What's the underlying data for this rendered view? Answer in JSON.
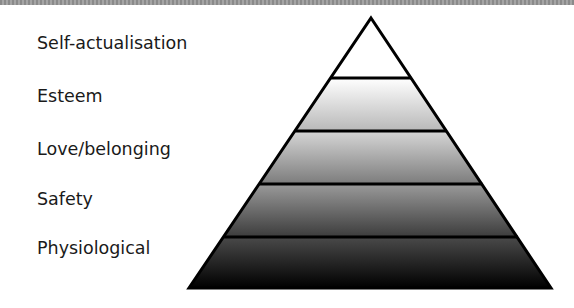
{
  "diagram": {
    "title": "",
    "type": "pyramid",
    "levels": [
      {
        "label": "Self-actualisation",
        "gradient": [
          "#ffffff",
          "#ffffff"
        ]
      },
      {
        "label": "Esteem",
        "gradient": [
          "#ffffff",
          "#b8b8b8"
        ]
      },
      {
        "label": "Love/belonging",
        "gradient": [
          "#d6d6d6",
          "#7c7c7c"
        ]
      },
      {
        "label": "Safety",
        "gradient": [
          "#9a9a9a",
          "#3c3c3c"
        ]
      },
      {
        "label": "Physiological",
        "gradient": [
          "#4a4a4a",
          "#000000"
        ]
      }
    ],
    "stroke_color": "#000000",
    "top_bar_color": "#999999"
  }
}
